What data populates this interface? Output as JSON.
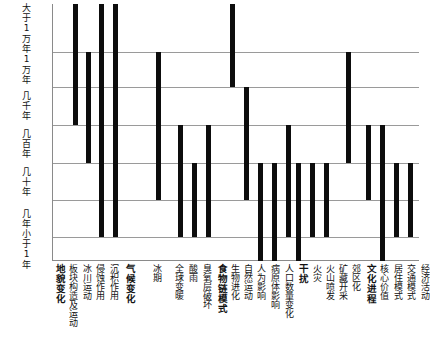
{
  "chart_data": {
    "type": "bar",
    "title": "",
    "subtitle": "",
    "xlabel": "",
    "ylabel": "",
    "grid": true,
    "legend": null,
    "orientation": "vertical-range-bars",
    "note": "Each bar spans the range of characteristic time scales over which that process operates.",
    "y_axis": {
      "type": "categorical-ordinal-log-time",
      "direction": "descending",
      "tick_labels": [
        "大于1万年",
        "1万年",
        "几千年",
        "几百年",
        "几十年",
        "几年",
        "小于1年"
      ],
      "band_boundaries_px": [
        4,
        52,
        87,
        125,
        163,
        200,
        237,
        261
      ]
    },
    "groups": [
      {
        "label": "地貌变化",
        "bold": true
      },
      {
        "label": "气候变化",
        "bold": true
      },
      {
        "label": "食物链模式",
        "bold": true
      },
      {
        "label": "干扰",
        "bold": true
      },
      {
        "label": "文化进程",
        "bold": true
      }
    ],
    "categories": [
      "地貌变化",
      "板块构造及运动",
      "冰川运动",
      "侵蚀作用",
      "沉积作用",
      "气候变化",
      "冰期",
      "全球变暖",
      "酸雨",
      "臭氧层破坏",
      "食物链模式",
      "生物进化",
      "自然运动",
      "人为影响",
      "病原体影响",
      "人口数量变化",
      "干扰",
      "火灾",
      "火山喷发",
      "矿藏开采",
      "郊区化",
      "文化进程",
      "核心价值",
      "居住模式",
      "交通模式",
      "经济活动"
    ],
    "bars": [
      {
        "category": "板块构造及运动",
        "is_group_header": false,
        "x_px": 24,
        "top_band": 0,
        "bottom_band": 3,
        "y_top_px": 4,
        "y_bottom_px": 125
      },
      {
        "category": "冰川运动",
        "is_group_header": false,
        "x_px": 40,
        "top_band": 1,
        "bottom_band": 4,
        "y_top_px": 52,
        "y_bottom_px": 163
      },
      {
        "category": "侵蚀作用",
        "is_group_header": false,
        "x_px": 56,
        "top_band": 0,
        "bottom_band": 6,
        "y_top_px": 4,
        "y_bottom_px": 237
      },
      {
        "category": "沉积作用",
        "is_group_header": false,
        "x_px": 73,
        "top_band": 0,
        "bottom_band": 6,
        "y_top_px": 4,
        "y_bottom_px": 237
      },
      {
        "category": "冰期",
        "is_group_header": false,
        "x_px": 125,
        "top_band": 1,
        "bottom_band": 5,
        "y_top_px": 52,
        "y_bottom_px": 200
      },
      {
        "category": "全球变暖",
        "is_group_header": false,
        "x_px": 152,
        "top_band": 3,
        "bottom_band": 6,
        "y_top_px": 125,
        "y_bottom_px": 237
      },
      {
        "category": "酸雨",
        "is_group_header": false,
        "x_px": 169,
        "top_band": 4,
        "bottom_band": 6,
        "y_top_px": 163,
        "y_bottom_px": 237
      },
      {
        "category": "臭氧层破坏",
        "is_group_header": false,
        "x_px": 186,
        "top_band": 3,
        "bottom_band": 6,
        "y_top_px": 125,
        "y_bottom_px": 237
      },
      {
        "category": "生物进化",
        "is_group_header": false,
        "x_px": 215,
        "top_band": 0,
        "bottom_band": 2,
        "y_top_px": 4,
        "y_bottom_px": 87
      },
      {
        "category": "自然运动",
        "is_group_header": false,
        "x_px": 232,
        "top_band": 2,
        "bottom_band": 5,
        "y_top_px": 87,
        "y_bottom_px": 200
      },
      {
        "category": "人为影响",
        "is_group_header": false,
        "x_px": 249,
        "top_band": 4,
        "bottom_band": 7,
        "y_top_px": 163,
        "y_bottom_px": 261
      },
      {
        "category": "病原体影响",
        "is_group_header": false,
        "x_px": 265,
        "top_band": 4,
        "bottom_band": 7,
        "y_top_px": 163,
        "y_bottom_px": 261
      },
      {
        "category": "人口数量变化",
        "is_group_header": false,
        "x_px": 282,
        "top_band": 3,
        "bottom_band": 6,
        "y_top_px": 125,
        "y_bottom_px": 237
      },
      {
        "category": "火灾",
        "is_group_header": false,
        "x_px": 295,
        "top_band": 4,
        "bottom_band": 7,
        "y_top_px": 163,
        "y_bottom_px": 261
      },
      {
        "category": "火山喷发",
        "is_group_header": false,
        "x_px": 312,
        "top_band": 4,
        "bottom_band": 6,
        "y_top_px": 163,
        "y_bottom_px": 237
      },
      {
        "category": "矿藏开采",
        "is_group_header": false,
        "x_px": 329,
        "top_band": 4,
        "bottom_band": 6,
        "y_top_px": 163,
        "y_bottom_px": 237
      },
      {
        "category": "郊区化",
        "is_group_header": false,
        "x_px": 355,
        "top_band": 1,
        "bottom_band": 4,
        "y_top_px": 52,
        "y_bottom_px": 163
      },
      {
        "category": "核心价值",
        "is_group_header": false,
        "x_px": 379,
        "top_band": 3,
        "bottom_band": 5,
        "y_top_px": 125,
        "y_bottom_px": 200
      },
      {
        "category": "居住模式",
        "is_group_header": false,
        "x_px": 396,
        "top_band": 3,
        "bottom_band": 7,
        "y_top_px": 125,
        "y_bottom_px": 261
      },
      {
        "category": "交通模式",
        "is_group_header": false,
        "x_px": 413,
        "top_band": 4,
        "bottom_band": 6,
        "y_top_px": 163,
        "y_bottom_px": 237
      },
      {
        "category": "经济活动",
        "is_group_header": false,
        "x_px": 430,
        "top_band": 4,
        "bottom_band": 6,
        "y_top_px": 163,
        "y_bottom_px": 237
      }
    ],
    "x_tick_positions": [
      {
        "label": "地貌变化",
        "x_px": 10,
        "group": true
      },
      {
        "label": "板块构造及运动",
        "x_px": 26,
        "group": false
      },
      {
        "label": "冰川运动",
        "x_px": 42,
        "group": false
      },
      {
        "label": "侵蚀作用",
        "x_px": 58,
        "group": false
      },
      {
        "label": "沉积作用",
        "x_px": 75,
        "group": false
      },
      {
        "label": "气候变化",
        "x_px": 95,
        "group": true
      },
      {
        "label": "冰期",
        "x_px": 127,
        "group": false
      },
      {
        "label": "全球变暖",
        "x_px": 154,
        "group": false
      },
      {
        "label": "酸雨",
        "x_px": 171,
        "group": false
      },
      {
        "label": "臭氧层破坏",
        "x_px": 188,
        "group": false
      },
      {
        "label": "食物链模式",
        "x_px": 206,
        "group": true
      },
      {
        "label": "生物进化",
        "x_px": 222,
        "group": false
      },
      {
        "label": "自然运动",
        "x_px": 238,
        "group": false
      },
      {
        "label": "人为影响",
        "x_px": 254,
        "group": false
      },
      {
        "label": "病原体影响",
        "x_px": 270,
        "group": false
      },
      {
        "label": "人口数量变化",
        "x_px": 287,
        "group": false
      },
      {
        "label": "干扰",
        "x_px": 305,
        "group": true
      },
      {
        "label": "火灾",
        "x_px": 321,
        "group": false
      },
      {
        "label": "火山喷发",
        "x_px": 337,
        "group": false
      },
      {
        "label": "矿藏开采",
        "x_px": 353,
        "group": false
      },
      {
        "label": "郊区化",
        "x_px": 369,
        "group": false
      },
      {
        "label": "文化进程",
        "x_px": 387,
        "group": true
      },
      {
        "label": "核心价值",
        "x_px": 403,
        "group": false
      },
      {
        "label": "居住模式",
        "x_px": 419,
        "group": false
      },
      {
        "label": "交通模式",
        "x_px": 435,
        "group": false
      },
      {
        "label": "经济活动",
        "x_px": 452,
        "group": false
      }
    ]
  }
}
